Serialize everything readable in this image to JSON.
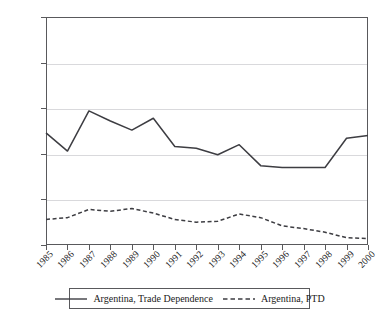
{
  "chart_data": {
    "type": "line",
    "title": "",
    "xlabel": "",
    "ylabel": "",
    "x": [
      "1985",
      "1986",
      "1987",
      "1988",
      "1989",
      "1990",
      "1991",
      "1992",
      "1993",
      "1994",
      "1995",
      "1996",
      "1997",
      "1998",
      "1999",
      "2000"
    ],
    "ylim": [
      0,
      25
    ],
    "ytick_values": [
      0,
      5,
      10,
      15,
      20,
      25
    ],
    "ytick_labels": [
      "0%",
      "5%",
      "10%",
      "15%",
      "20%",
      "25%"
    ],
    "grid": "horizontal",
    "legend_position": "bottom-center",
    "series": [
      {
        "name": "Argentina, Trade Dependence",
        "style": "solid",
        "color": "#3d3d42",
        "values": [
          12.3,
          10.3,
          14.7,
          13.6,
          12.6,
          13.9,
          10.8,
          10.6,
          9.9,
          11.0,
          8.7,
          8.5,
          8.5,
          8.5,
          11.7,
          12.0
        ]
      },
      {
        "name": "Argentina, PTD",
        "style": "dashed",
        "color": "#3d3d42",
        "values": [
          2.8,
          3.0,
          3.9,
          3.7,
          4.0,
          3.5,
          2.8,
          2.5,
          2.6,
          3.4,
          3.0,
          2.1,
          1.8,
          1.4,
          0.8,
          0.7
        ]
      }
    ]
  },
  "legend": {
    "entries": [
      {
        "label": "Argentina, Trade Dependence",
        "style": "solid"
      },
      {
        "label": "Argentina, PTD",
        "style": "dashed"
      }
    ]
  },
  "colors": {
    "axis": "#59595c",
    "grid": "#d9d9dc",
    "series": "#3d3d42",
    "background": "#ffffff"
  }
}
